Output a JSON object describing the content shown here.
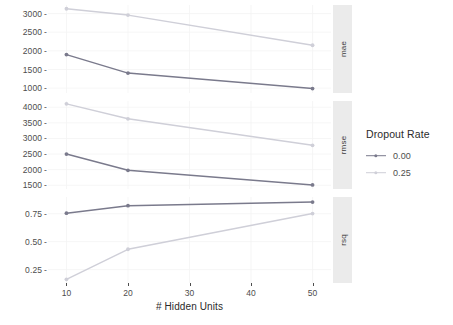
{
  "chart_data": {
    "type": "line",
    "title": "",
    "subtitle": "",
    "xlabel": "# Hidden Units",
    "ylabel": "",
    "x": [
      10,
      20,
      50
    ],
    "xlim": [
      7,
      53
    ],
    "xticks": [
      10,
      20,
      30,
      40,
      50
    ],
    "xtick_labels": [
      "10",
      "20",
      "30",
      "40",
      "50"
    ],
    "grid": true,
    "legend": {
      "position": "right",
      "title": "Dropout Rate",
      "entries": [
        {
          "label": "0.00",
          "color": "#7a7a8c"
        },
        {
          "label": "0.25",
          "color": "#cfcfd8"
        }
      ]
    },
    "facets": [
      {
        "strip_label": "mae",
        "yticks": [
          1000,
          1500,
          2000,
          2500,
          3000
        ],
        "ytick_labels": [
          "1000",
          "1500",
          "2000",
          "2500",
          "3000"
        ],
        "ylim": [
          870,
          3230
        ],
        "series": [
          {
            "name": "0.00",
            "color": "#7a7a8c",
            "values": [
              1900,
              1405,
              990
            ]
          },
          {
            "name": "0.25",
            "color": "#cfcfd8",
            "values": [
              3130,
              2960,
              2150
            ]
          }
        ]
      },
      {
        "strip_label": "rmse",
        "yticks": [
          1500,
          2000,
          2500,
          3000,
          3500,
          4000
        ],
        "ytick_labels": [
          "1500",
          "2000",
          "2500",
          "3000",
          "3500",
          "4000"
        ],
        "ylim": [
          1380,
          4200
        ],
        "series": [
          {
            "name": "0.00",
            "color": "#7a7a8c",
            "values": [
              2500,
              1980,
              1510
            ]
          },
          {
            "name": "0.25",
            "color": "#cfcfd8",
            "values": [
              4110,
              3630,
              2780
            ]
          }
        ]
      },
      {
        "strip_label": "rsq",
        "yticks": [
          0.25,
          0.5,
          0.75
        ],
        "ytick_labels": [
          "0.25",
          "0.50",
          "0.75"
        ],
        "ylim": [
          0.13,
          0.9
        ],
        "series": [
          {
            "name": "0.00",
            "color": "#7a7a8c",
            "values": [
              0.755,
              0.822,
              0.855
            ]
          },
          {
            "name": "0.25",
            "color": "#cfcfd8",
            "values": [
              0.163,
              0.432,
              0.752
            ]
          }
        ]
      }
    ]
  },
  "axis": {
    "x_title": "# Hidden Units"
  },
  "legend": {
    "title": "Dropout Rate",
    "items": [
      {
        "label": "0.00"
      },
      {
        "label": "0.25"
      }
    ]
  },
  "colors": {
    "series_low": "#7a7a8c",
    "series_high": "#cfcfd8",
    "strip_bg": "#ebebeb",
    "grid": "#f4f4f4",
    "text": "#4d4d4d",
    "panel_bg": "#ffffff"
  }
}
